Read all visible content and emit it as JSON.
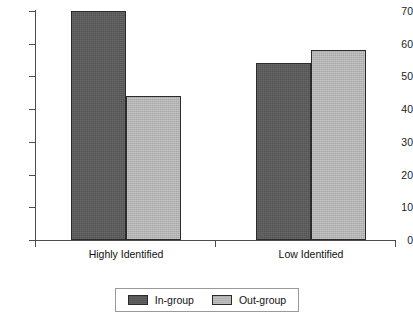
{
  "chart_data": {
    "type": "bar",
    "title": "",
    "subtitle": "",
    "xlabel": "",
    "ylabel": "",
    "categories": [
      "Highly Identified",
      "Low Identified"
    ],
    "series": [
      {
        "name": "In-group",
        "values": [
          70,
          54
        ],
        "color": "#5a5a5a"
      },
      {
        "name": "Out-group",
        "values": [
          44,
          58
        ],
        "color": "#b9b9b9"
      }
    ],
    "ylim": [
      0,
      70
    ],
    "ytick_labels": [
      "0",
      "10",
      "20",
      "30",
      "40",
      "50",
      "60",
      "70"
    ],
    "ytick_values": [
      0,
      10,
      20,
      30,
      40,
      50,
      60,
      70
    ],
    "grid": false,
    "legend_position": "bottom",
    "axis_color": "#4c4c4c",
    "bar_edge_color": "#2b2b2b",
    "background": "#ffffff"
  },
  "legend": {
    "entries": [
      {
        "label": "In-group"
      },
      {
        "label": "Out-group"
      }
    ]
  }
}
